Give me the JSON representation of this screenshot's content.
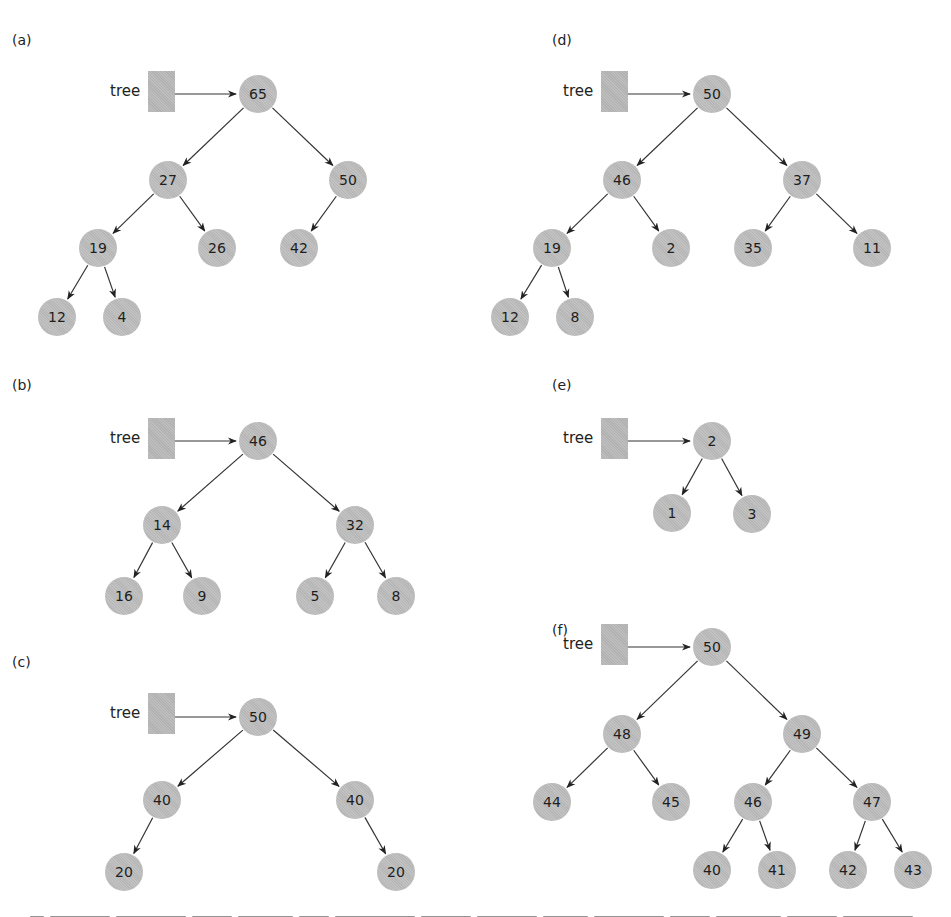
{
  "figure": {
    "pointer_label": "tree",
    "colors": {
      "node_fill": "#bdbdbd",
      "box_fill": "#b8b8b8",
      "edge": "#333333",
      "text": "#1e1e1e"
    },
    "panels": [
      {
        "id": "a",
        "label": "(a)",
        "label_pos": [
          12,
          32
        ],
        "box": [
          148,
          71
        ],
        "root_y": 94,
        "nodes": [
          {
            "id": "a0",
            "value": "65",
            "x": 258,
            "y": 94
          },
          {
            "id": "a1",
            "value": "27",
            "x": 168,
            "y": 180
          },
          {
            "id": "a2",
            "value": "50",
            "x": 348,
            "y": 180
          },
          {
            "id": "a3",
            "value": "19",
            "x": 98,
            "y": 248
          },
          {
            "id": "a4",
            "value": "26",
            "x": 217,
            "y": 248
          },
          {
            "id": "a5",
            "value": "42",
            "x": 299,
            "y": 248
          },
          {
            "id": "a6",
            "value": "12",
            "x": 57,
            "y": 317
          },
          {
            "id": "a7",
            "value": "4",
            "x": 122,
            "y": 317
          }
        ],
        "edges": [
          [
            "a0",
            "a1"
          ],
          [
            "a0",
            "a2"
          ],
          [
            "a1",
            "a3"
          ],
          [
            "a1",
            "a4"
          ],
          [
            "a2",
            "a5"
          ],
          [
            "a3",
            "a6"
          ],
          [
            "a3",
            "a7"
          ]
        ]
      },
      {
        "id": "b",
        "label": "(b)",
        "label_pos": [
          12,
          377
        ],
        "box": [
          148,
          418
        ],
        "root_y": 441,
        "nodes": [
          {
            "id": "b0",
            "value": "46",
            "x": 258,
            "y": 441
          },
          {
            "id": "b1",
            "value": "14",
            "x": 162,
            "y": 525
          },
          {
            "id": "b2",
            "value": "32",
            "x": 355,
            "y": 525
          },
          {
            "id": "b3",
            "value": "16",
            "x": 124,
            "y": 596
          },
          {
            "id": "b4",
            "value": "9",
            "x": 202,
            "y": 596
          },
          {
            "id": "b5",
            "value": "5",
            "x": 315,
            "y": 596
          },
          {
            "id": "b6",
            "value": "8",
            "x": 396,
            "y": 596
          }
        ],
        "edges": [
          [
            "b0",
            "b1"
          ],
          [
            "b0",
            "b2"
          ],
          [
            "b1",
            "b3"
          ],
          [
            "b1",
            "b4"
          ],
          [
            "b2",
            "b5"
          ],
          [
            "b2",
            "b6"
          ]
        ]
      },
      {
        "id": "c",
        "label": "(c)",
        "label_pos": [
          12,
          654
        ],
        "box": [
          148,
          693
        ],
        "root_y": 717,
        "nodes": [
          {
            "id": "c0",
            "value": "50",
            "x": 258,
            "y": 717
          },
          {
            "id": "c1",
            "value": "40",
            "x": 162,
            "y": 800
          },
          {
            "id": "c2",
            "value": "40",
            "x": 355,
            "y": 800
          },
          {
            "id": "c3",
            "value": "20",
            "x": 124,
            "y": 872
          },
          {
            "id": "c4",
            "value": "20",
            "x": 396,
            "y": 872
          }
        ],
        "edges": [
          [
            "c0",
            "c1"
          ],
          [
            "c0",
            "c2"
          ],
          [
            "c1",
            "c3"
          ],
          [
            "c2",
            "c4"
          ]
        ]
      },
      {
        "id": "d",
        "label": "(d)",
        "label_pos": [
          552,
          32
        ],
        "box": [
          601,
          71
        ],
        "root_y": 94,
        "nodes": [
          {
            "id": "d0",
            "value": "50",
            "x": 712,
            "y": 94
          },
          {
            "id": "d1",
            "value": "46",
            "x": 622,
            "y": 180
          },
          {
            "id": "d2",
            "value": "37",
            "x": 802,
            "y": 180
          },
          {
            "id": "d3",
            "value": "19",
            "x": 552,
            "y": 248
          },
          {
            "id": "d4",
            "value": "2",
            "x": 671,
            "y": 248
          },
          {
            "id": "d5",
            "value": "35",
            "x": 753,
            "y": 248
          },
          {
            "id": "d6",
            "value": "11",
            "x": 872,
            "y": 248
          },
          {
            "id": "d7",
            "value": "12",
            "x": 510,
            "y": 317
          },
          {
            "id": "d8",
            "value": "8",
            "x": 575,
            "y": 317
          }
        ],
        "edges": [
          [
            "d0",
            "d1"
          ],
          [
            "d0",
            "d2"
          ],
          [
            "d1",
            "d3"
          ],
          [
            "d1",
            "d4"
          ],
          [
            "d2",
            "d5"
          ],
          [
            "d2",
            "d6"
          ],
          [
            "d3",
            "d7"
          ],
          [
            "d3",
            "d8"
          ]
        ]
      },
      {
        "id": "e",
        "label": "(e)",
        "label_pos": [
          552,
          377
        ],
        "box": [
          601,
          418
        ],
        "root_y": 441,
        "nodes": [
          {
            "id": "e0",
            "value": "2",
            "x": 712,
            "y": 441
          },
          {
            "id": "e1",
            "value": "1",
            "x": 672,
            "y": 513
          },
          {
            "id": "e2",
            "value": "3",
            "x": 752,
            "y": 514
          }
        ],
        "edges": [
          [
            "e0",
            "e1"
          ],
          [
            "e0",
            "e2"
          ]
        ]
      },
      {
        "id": "f",
        "label": "(f)",
        "label_pos": [
          552,
          622
        ],
        "box": [
          601,
          624
        ],
        "root_y": 647,
        "nodes": [
          {
            "id": "f0",
            "value": "50",
            "x": 712,
            "y": 647
          },
          {
            "id": "f1",
            "value": "48",
            "x": 622,
            "y": 734
          },
          {
            "id": "f2",
            "value": "49",
            "x": 802,
            "y": 734
          },
          {
            "id": "f3",
            "value": "44",
            "x": 552,
            "y": 802
          },
          {
            "id": "f4",
            "value": "45",
            "x": 671,
            "y": 802
          },
          {
            "id": "f5",
            "value": "46",
            "x": 753,
            "y": 802
          },
          {
            "id": "f6",
            "value": "47",
            "x": 872,
            "y": 802
          },
          {
            "id": "f7",
            "value": "40",
            "x": 712,
            "y": 870
          },
          {
            "id": "f8",
            "value": "41",
            "x": 777,
            "y": 870
          },
          {
            "id": "f9",
            "value": "42",
            "x": 848,
            "y": 870
          },
          {
            "id": "f10",
            "value": "43",
            "x": 913,
            "y": 870
          }
        ],
        "edges": [
          [
            "f0",
            "f1"
          ],
          [
            "f0",
            "f2"
          ],
          [
            "f1",
            "f3"
          ],
          [
            "f1",
            "f4"
          ],
          [
            "f2",
            "f5"
          ],
          [
            "f2",
            "f6"
          ],
          [
            "f5",
            "f7"
          ],
          [
            "f5",
            "f8"
          ],
          [
            "f6",
            "f9"
          ],
          [
            "f6",
            "f10"
          ]
        ]
      }
    ]
  }
}
